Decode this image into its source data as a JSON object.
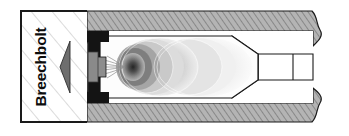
{
  "figure": {
    "kind": "technical-cutaway-diagram",
    "width": 349,
    "height": 136,
    "background_color": "#ffffff"
  },
  "callout_box": {
    "label": "Breechbolt",
    "label_rotation_degrees": -90,
    "border_color": "#1a1a1a",
    "border_width": 2,
    "fill_color": "#ffffff",
    "hatch_color": "#b8b8b8",
    "x": 21,
    "y": 11,
    "width": 66,
    "height": 111
  },
  "breechbolt": {
    "name": "breechbolt",
    "description": "Threaded bolt body with serrated thread flanks and a tapered nose entering the chamber",
    "body_color": "#6b6b6b",
    "thread_color": "#4a4a4a",
    "shank_color": "#8f8f8f",
    "thread_count": 8
  },
  "barrel": {
    "name": "barrel-wall",
    "wall_color": "#b0b0b0",
    "hatch_color": "#7d7d7d",
    "outline_color": "#1a1a1a",
    "top_wall_y": 11,
    "bottom_wall_y": 122,
    "break_edge": "wavy",
    "break_edge_x": 312
  },
  "breech_face": {
    "name": "breech-face",
    "color": "#141414",
    "description": "Dark breech face / case head recess framing the chamber mouth"
  },
  "chamber": {
    "name": "combustion-chamber",
    "description": "Propellant gas expansion field rendered as concentric greyscale contours",
    "ignition_core_color": "#2b2b2b",
    "outer_gas_color": "#f2f2f2",
    "contour_levels": 7,
    "ignition_point": {
      "x": 133,
      "y": 67
    }
  },
  "forcing_cone": {
    "name": "forcing-cone",
    "description": "Tapered transition narrowing chamber diameter down to bore diameter",
    "color": "#b0b0b0"
  },
  "bore": {
    "name": "bore",
    "description": "Open bore downstream of the forcing cone",
    "color": "#ffffff",
    "outline_color": "#1a1a1a"
  },
  "gas_plume": {
    "name": "gas-jet",
    "description": "Fine gas jet streaks escaping past the bolt nose into the chamber",
    "color": "#9a9a9a"
  },
  "colors": {
    "ink": "#1a1a1a",
    "steel_light": "#b0b0b0",
    "steel_dark": "#7d7d7d",
    "dark": "#141414",
    "paper": "#ffffff"
  }
}
